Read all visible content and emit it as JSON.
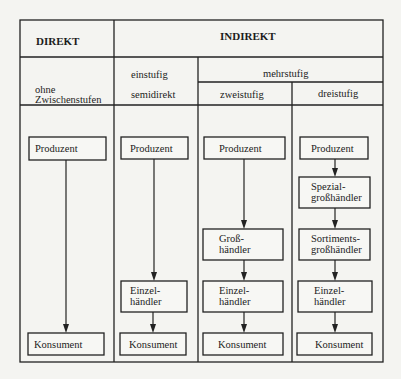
{
  "diagram": {
    "type": "distribution-channels",
    "colors": {
      "line": "#222222",
      "background": "#f4f4f1"
    },
    "header": {
      "direkt": "DIREKT",
      "indirekt": "INDIREKT",
      "ohne_line1": "ohne",
      "ohne_line2": "Zwischenstufen",
      "einstufig": "einstufig",
      "semidirekt": "semidirekt",
      "mehrstufig": "mehrstufig",
      "zweistufig": "zweistufig",
      "dreistufig": "dreistufig"
    },
    "columns": [
      {
        "name": "direkt",
        "nodes": [
          {
            "line1": "Produzent"
          },
          {
            "line1": "Konsument"
          }
        ]
      },
      {
        "name": "einstufig",
        "nodes": [
          {
            "line1": "Produzent"
          },
          {
            "line1": "Einzel-",
            "line2": "händler"
          },
          {
            "line1": "Konsument"
          }
        ]
      },
      {
        "name": "zweistufig",
        "nodes": [
          {
            "line1": "Produzent"
          },
          {
            "line1": "Groß-",
            "line2": "händler"
          },
          {
            "line1": "Einzel-",
            "line2": "händler"
          },
          {
            "line1": "Konsument"
          }
        ]
      },
      {
        "name": "dreistufig",
        "nodes": [
          {
            "line1": "Produzent"
          },
          {
            "line1": "Spezial-",
            "line2": "großhändler"
          },
          {
            "line1": "Sortiments-",
            "line2": "großhändler"
          },
          {
            "line1": "Einzel-",
            "line2": "händler"
          },
          {
            "line1": "Konsument"
          }
        ]
      }
    ]
  }
}
